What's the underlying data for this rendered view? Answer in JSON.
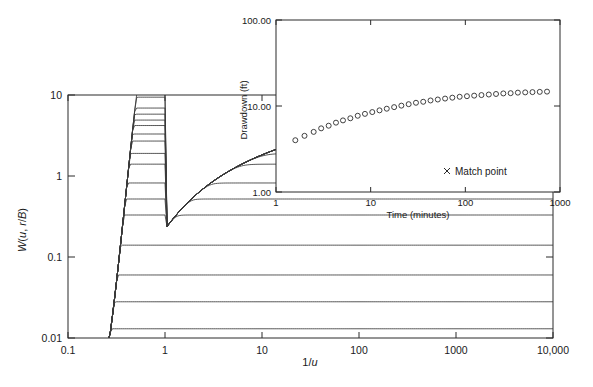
{
  "figure": {
    "background": "#ffffff",
    "line_color": "#3a3a3a",
    "axis_color": "#2b2b2b"
  },
  "chart_data": {
    "type": "line",
    "title": "",
    "main_plot": {
      "xlabel": "1/u",
      "ylabel": "W(u, r/B)",
      "xscale": "log",
      "yscale": "log",
      "xlim": [
        0.1,
        10000
      ],
      "ylim": [
        0.01,
        10
      ],
      "xticks": [
        0.1,
        1,
        10,
        100,
        1000,
        10000
      ],
      "xtick_labels": [
        "0.1",
        "1",
        "10",
        "100",
        "1000",
        "10,000"
      ],
      "yticks": [
        0.01,
        0.1,
        1,
        10
      ],
      "ytick_labels": [
        "0.01",
        "0.1",
        "1",
        "10"
      ],
      "grid": false,
      "legend_position": "none",
      "series_label": "r/B",
      "series": [
        {
          "name": "r/B = 0.005",
          "plateau": 10.8
        },
        {
          "name": "r/B = 0.01",
          "plateau": 9.4
        },
        {
          "name": "r/B = 0.03",
          "plateau": 6.9
        },
        {
          "name": "r/B = 0.05",
          "plateau": 5.8
        },
        {
          "name": "r/B = 0.075",
          "plateau": 4.9
        },
        {
          "name": "r/B = 0.1",
          "plateau": 4.2
        },
        {
          "name": "r/B = 0.15",
          "plateau": 3.3
        },
        {
          "name": "r/B = 0.2",
          "plateau": 2.7
        },
        {
          "name": "r/B = 0.3",
          "plateau": 1.9
        },
        {
          "name": "r/B = 0.4",
          "plateau": 1.4
        },
        {
          "name": "r/B = 0.6",
          "plateau": 0.82
        },
        {
          "name": "r/B = 0.8",
          "plateau": 0.52
        },
        {
          "name": "r/B = 1.0",
          "plateau": 0.33
        },
        {
          "name": "r/B = 1.5",
          "plateau": 0.14
        },
        {
          "name": "r/B = 2.0",
          "plateau": 0.06
        },
        {
          "name": "r/B = 2.5",
          "plateau": 0.028
        },
        {
          "name": "r/B = 3.0",
          "plateau": 0.013
        }
      ]
    },
    "inset_plot": {
      "xlabel": "Time (minutes)",
      "ylabel": "Drawdown (ft)",
      "xscale": "log",
      "yscale": "log",
      "xlim": [
        1,
        1000
      ],
      "ylim": [
        1,
        100
      ],
      "xticks": [
        1,
        10,
        100,
        1000
      ],
      "xtick_labels": [
        "1",
        "10",
        "100",
        "1000"
      ],
      "yticks": [
        1,
        10,
        100
      ],
      "ytick_labels": [
        "1.00",
        "10.00",
        "100.00"
      ],
      "grid": false,
      "legend_position": "inside-lower-right",
      "legend_entries": [
        {
          "label": "Match point",
          "marker": "x"
        }
      ],
      "data_series": {
        "name": "Observed drawdown",
        "marker": "open-circle",
        "points": [
          {
            "t": 1.6,
            "s": 4.0
          },
          {
            "t": 2.0,
            "s": 4.5
          },
          {
            "t": 2.5,
            "s": 5.0
          },
          {
            "t": 3.0,
            "s": 5.5
          },
          {
            "t": 3.6,
            "s": 5.9
          },
          {
            "t": 4.3,
            "s": 6.4
          },
          {
            "t": 5.1,
            "s": 6.8
          },
          {
            "t": 6.1,
            "s": 7.2
          },
          {
            "t": 7.3,
            "s": 7.7
          },
          {
            "t": 8.7,
            "s": 8.1
          },
          {
            "t": 10.4,
            "s": 8.5
          },
          {
            "t": 12.4,
            "s": 8.9
          },
          {
            "t": 14.8,
            "s": 9.3
          },
          {
            "t": 17.7,
            "s": 9.7
          },
          {
            "t": 21.1,
            "s": 10.1
          },
          {
            "t": 25.2,
            "s": 10.5
          },
          {
            "t": 30.1,
            "s": 10.9
          },
          {
            "t": 35.9,
            "s": 11.2
          },
          {
            "t": 42.9,
            "s": 11.6
          },
          {
            "t": 51.2,
            "s": 11.9
          },
          {
            "t": 61.1,
            "s": 12.2
          },
          {
            "t": 72.9,
            "s": 12.5
          },
          {
            "t": 87.1,
            "s": 12.8
          },
          {
            "t": 104,
            "s": 13.0
          },
          {
            "t": 124,
            "s": 13.2
          },
          {
            "t": 148,
            "s": 13.4
          },
          {
            "t": 177,
            "s": 13.6
          },
          {
            "t": 211,
            "s": 13.8
          },
          {
            "t": 252,
            "s": 14.0
          },
          {
            "t": 301,
            "s": 14.1
          },
          {
            "t": 359,
            "s": 14.3
          },
          {
            "t": 429,
            "s": 14.4
          },
          {
            "t": 512,
            "s": 14.5
          },
          {
            "t": 611,
            "s": 14.6
          },
          {
            "t": 729,
            "s": 14.7
          }
        ]
      }
    }
  },
  "main_axis": {
    "x_title": "1/u",
    "y_title": "W(u, r/B)",
    "x_tick_labels": [
      "0.1",
      "1",
      "10",
      "100",
      "1000",
      "10,000"
    ],
    "y_tick_labels": [
      "0.01",
      "0.1",
      "1",
      "10"
    ]
  },
  "inset_axis": {
    "x_title": "Time (minutes)",
    "y_title": "Drawdown (ft)",
    "x_tick_labels": [
      "1",
      "10",
      "100",
      "1000"
    ],
    "y_tick_labels": [
      "1.00",
      "10.00",
      "100.00"
    ]
  },
  "legend": {
    "match_point_label": "Match point",
    "match_point_marker": "x"
  }
}
